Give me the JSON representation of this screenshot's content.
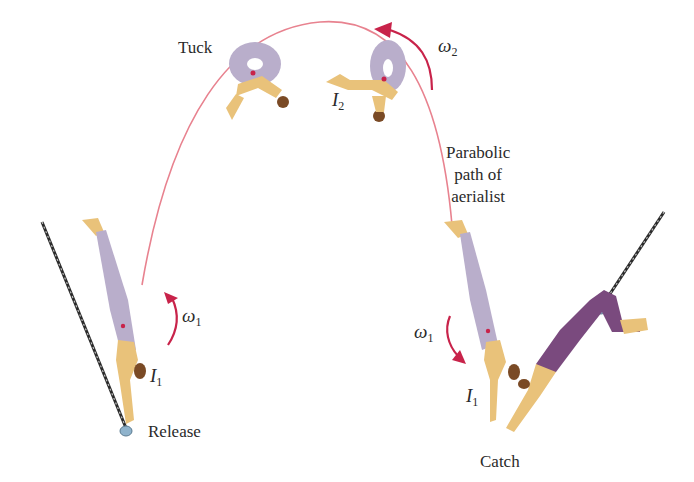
{
  "labels": {
    "tuck": "Tuck",
    "release": "Release",
    "catch": "Catch",
    "parabolic_path": "Parabolic\npath of\naerialist"
  },
  "symbols": {
    "omega_2": {
      "base": "ω",
      "sub": "2"
    },
    "omega_1_left": {
      "base": "ω",
      "sub": "1"
    },
    "omega_1_right": {
      "base": "ω",
      "sub": "1"
    },
    "I_2": {
      "base": "I",
      "sub": "2"
    },
    "I_1_left": {
      "base": "I",
      "sub": "1"
    },
    "I_1_right": {
      "base": "I",
      "sub": "1"
    }
  },
  "colors": {
    "path": "#e8828f",
    "arrow": "#c8234a",
    "flyer_suit": "#b9aecb",
    "catcher_suit": "#7a4a7e",
    "skin": "#e9c27a",
    "hair": "#7a4a25",
    "rope": "#3a3a3a",
    "bar": "#8fb3cc",
    "com_dot": "#c8234a"
  }
}
